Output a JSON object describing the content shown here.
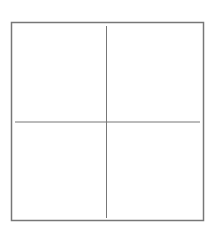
{
  "diagram": {
    "type": "quadrant-grid",
    "background": "#ffffff",
    "stroke_color": "#777777",
    "frame": {
      "x1": 11.5,
      "y1": 22.5,
      "x2": 203.5,
      "y2": 220.5,
      "stroke_width": 1.5
    },
    "vertical_divider": {
      "x": 106.5,
      "y1": 26,
      "y2": 218,
      "stroke_width": 1
    },
    "horizontal_divider": {
      "y": 122,
      "x1": 15,
      "x2": 200,
      "stroke_width": 1
    },
    "quadrants": [
      {
        "position": "top-left",
        "label": ""
      },
      {
        "position": "top-right",
        "label": ""
      },
      {
        "position": "bottom-left",
        "label": ""
      },
      {
        "position": "bottom-right",
        "label": ""
      }
    ]
  }
}
